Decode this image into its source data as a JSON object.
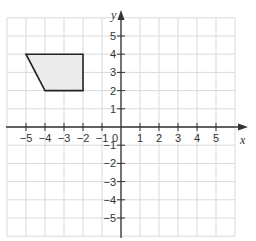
{
  "chart_data": {
    "type": "scatter",
    "title": "",
    "xlabel": "x",
    "ylabel": "y",
    "xlim": [
      -6,
      6
    ],
    "ylim": [
      -6,
      6
    ],
    "grid": true,
    "x_ticks": [
      -5,
      -4,
      -3,
      -2,
      -1,
      1,
      2,
      3,
      4,
      5
    ],
    "y_ticks": [
      -5,
      -4,
      -3,
      -2,
      -1,
      1,
      2,
      3,
      4,
      5
    ],
    "x_tick_labels": [
      "−5",
      "−4",
      "−3",
      "−2",
      "−1",
      "1",
      "2",
      "3",
      "4",
      "5"
    ],
    "y_tick_labels": [
      "−5",
      "−4",
      "−3",
      "−2",
      "−1",
      "1",
      "2",
      "3",
      "4",
      "5"
    ],
    "origin_label": "0",
    "shapes": [
      {
        "name": "trapezoid",
        "vertices": [
          [
            -5,
            4
          ],
          [
            -2,
            4
          ],
          [
            -2,
            2
          ],
          [
            -4,
            2
          ]
        ],
        "fill": "#ebebeb",
        "stroke": "#222222"
      }
    ]
  },
  "colors": {
    "grid": "#d9d9d9",
    "axis": "#333333"
  }
}
